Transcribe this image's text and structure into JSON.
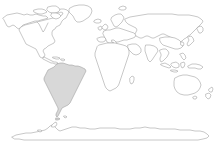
{
  "map": {
    "title": "World Map",
    "projection": "equirectangular",
    "background_color": "#ffffff",
    "coastline_color": "#9a9a9a",
    "default_land_fill": "#ffffff",
    "highlight_fill": "#d8d8d8",
    "width": 221,
    "height": 149,
    "highlighted_region": "South America",
    "regions": [
      {
        "id": "north-america",
        "label": "North America",
        "highlighted": false
      },
      {
        "id": "greenland",
        "label": "Greenland",
        "highlighted": false
      },
      {
        "id": "central-america",
        "label": "Central America",
        "highlighted": false
      },
      {
        "id": "south-america",
        "label": "South America",
        "highlighted": true
      },
      {
        "id": "europe",
        "label": "Europe",
        "highlighted": false
      },
      {
        "id": "british-isles",
        "label": "British Isles",
        "highlighted": false
      },
      {
        "id": "scandinavia",
        "label": "Scandinavia",
        "highlighted": false
      },
      {
        "id": "africa",
        "label": "Africa",
        "highlighted": false
      },
      {
        "id": "madagascar",
        "label": "Madagascar",
        "highlighted": false
      },
      {
        "id": "asia",
        "label": "Asia",
        "highlighted": false
      },
      {
        "id": "japan",
        "label": "Japan",
        "highlighted": false
      },
      {
        "id": "indonesia",
        "label": "Indonesia",
        "highlighted": false
      },
      {
        "id": "philippines",
        "label": "Philippines",
        "highlighted": false
      },
      {
        "id": "new-guinea",
        "label": "New Guinea",
        "highlighted": false
      },
      {
        "id": "australia",
        "label": "Australia",
        "highlighted": false
      },
      {
        "id": "new-zealand",
        "label": "New Zealand",
        "highlighted": false
      },
      {
        "id": "antarctica",
        "label": "Antarctica",
        "highlighted": false
      }
    ]
  }
}
